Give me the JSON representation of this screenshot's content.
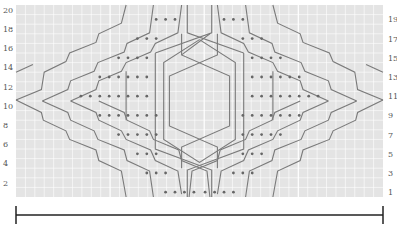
{
  "chart_data": {
    "type": "table",
    "title": "",
    "rows": 20,
    "columns": 39,
    "left_row_labels": [
      "2",
      "4",
      "6",
      "8",
      "10",
      "12",
      "14",
      "16",
      "18",
      "20"
    ],
    "right_row_labels": [
      "1",
      "3",
      "5",
      "7",
      "9",
      "11",
      "13",
      "15",
      "17",
      "19"
    ],
    "grid": {
      "on": true,
      "color": "#ffffff",
      "background": "#e4e4e4"
    },
    "line_color": "#7a7a7a",
    "dot_color": "#666666",
    "repeat_bar": {
      "label": "",
      "from_col": 0,
      "to_col": 39
    }
  },
  "labels": {
    "left": [
      {
        "text": "20",
        "row": 20
      },
      {
        "text": "18",
        "row": 18
      },
      {
        "text": "16",
        "row": 16
      },
      {
        "text": "14",
        "row": 14
      },
      {
        "text": "12",
        "row": 12
      },
      {
        "text": "10",
        "row": 10
      },
      {
        "text": "8",
        "row": 8
      },
      {
        "text": "6",
        "row": 6
      },
      {
        "text": "4",
        "row": 4
      },
      {
        "text": "2",
        "row": 2
      }
    ],
    "right": [
      {
        "text": "19",
        "row": 19
      },
      {
        "text": "17",
        "row": 17
      },
      {
        "text": "15",
        "row": 15
      },
      {
        "text": "13",
        "row": 13
      },
      {
        "text": "11",
        "row": 11
      },
      {
        "text": "9",
        "row": 9
      },
      {
        "text": "7",
        "row": 7
      },
      {
        "text": "5",
        "row": 5
      },
      {
        "text": "3",
        "row": 3
      },
      {
        "text": "1",
        "row": 1
      }
    ]
  }
}
